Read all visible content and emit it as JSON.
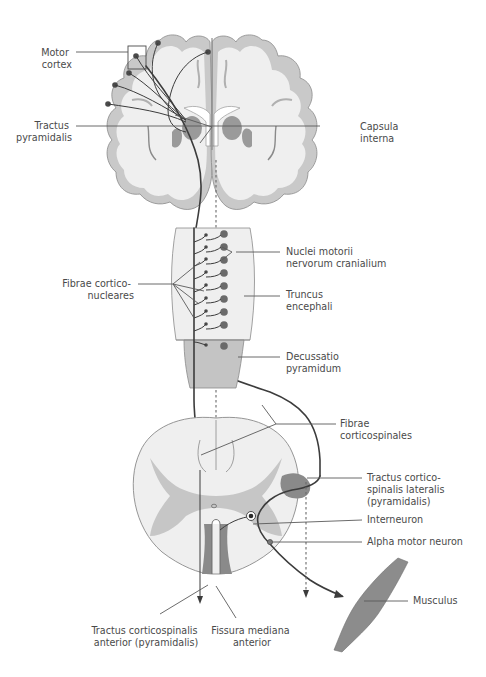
{
  "figure": {
    "type": "anatomical-diagram",
    "colors": {
      "background": "#ffffff",
      "white_matter": "#efefef",
      "cortex_gray": "#c9c9c9",
      "nuclei_dark": "#9a9a9a",
      "tract_line": "#3c3c3c",
      "label_text": "#4a4a4a",
      "muscle": "#8c8c8c"
    }
  },
  "labels": {
    "motor_cortex": [
      "Motor",
      "cortex"
    ],
    "tractus_pyramidalis": [
      "Tractus",
      "pyramidalis"
    ],
    "capsula_interna": [
      "Capsula",
      "interna"
    ],
    "nuclei_motorii": [
      "Nuclei motorii",
      "nervorum cranialium"
    ],
    "fibrae_corticonucleares": [
      "Fibrae cortico-",
      "nucleares"
    ],
    "truncus_encephali": [
      "Truncus",
      "encephali"
    ],
    "decussatio_pyramidum": [
      "Decussatio",
      "pyramidum"
    ],
    "fibrae_corticospinales": [
      "Fibrae",
      "corticospinales"
    ],
    "tractus_lateralis": [
      "Tractus cortico-",
      "spinalis lateralis",
      "(pyramidalis)"
    ],
    "interneuron": [
      "Interneuron"
    ],
    "alpha_motor_neuron": [
      "Alpha motor neuron"
    ],
    "musculus": [
      "Musculus"
    ],
    "tractus_anterior": [
      "Tractus corticospinalis",
      "anterior (pyramidalis)"
    ],
    "fissura_mediana": [
      "Fissura mediana",
      "anterior"
    ]
  }
}
